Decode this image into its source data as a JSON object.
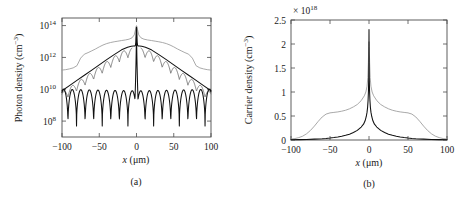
{
  "figure": {
    "panels": [
      "a",
      "b"
    ]
  },
  "panel_a": {
    "caption": "(a)",
    "ylabel": "Photon density (cm",
    "ylabel_exp": "−3",
    "ylabel_close": ")",
    "xlabel_var": "x",
    "xlabel_unit": "(μm)",
    "yticks": [
      "10",
      "10",
      "10",
      "10"
    ],
    "ytick_exps": [
      "8",
      "10",
      "12",
      "14"
    ],
    "xticks": [
      "−100",
      "−50",
      "0",
      "50",
      "100"
    ]
  },
  "panel_b": {
    "caption": "(b)",
    "ylabel": "Carrier density (cm",
    "ylabel_exp": "−3",
    "ylabel_close": ")",
    "xlabel_var": "x",
    "xlabel_unit": "(μm)",
    "exponent_label": "× 10",
    "exponent_sup": "18",
    "yticks": [
      "0",
      "0.5",
      "1",
      "1.5",
      "2",
      "2.5"
    ],
    "xticks": [
      "−100",
      "−50",
      "0",
      "50",
      "100"
    ]
  },
  "chart_data": [
    {
      "type": "line",
      "panel": "a",
      "title": "",
      "xlabel": "x (μm)",
      "ylabel": "Photon density (cm^-3)",
      "xlim": [
        -100,
        100
      ],
      "ylim": [
        10000000.0,
        300000000000000.0
      ],
      "yscale": "log",
      "xticks": [
        -100,
        -50,
        0,
        50,
        100
      ],
      "yticks": [
        100000000.0,
        10000000000.0,
        1000000000000.0,
        100000000000000.0
      ],
      "grid": false,
      "legend": "none",
      "series": [
        {
          "name": "upper-gray-broad",
          "color": "#9a9a9a",
          "comment": "smooth broad gray profile, plateau near 1e13, peak 1e14 at center",
          "x": [
            -100,
            -95,
            -90,
            -85,
            -80,
            -75,
            -70,
            -65,
            -60,
            -55,
            -50,
            -45,
            -40,
            -35,
            -30,
            -25,
            -20,
            -15,
            -10,
            -6,
            -3,
            -1.2,
            -0.5,
            0,
            0.5,
            1.2,
            3,
            6,
            10,
            15,
            20,
            25,
            30,
            35,
            40,
            45,
            50,
            55,
            60,
            65,
            70,
            75,
            80,
            85,
            90,
            95,
            100
          ],
          "y": [
            160000000000.0,
            170000000000.0,
            190000000000.0,
            220000000000.0,
            300000000000.0,
            900000000000.0,
            1600000000000.0,
            2000000000000.0,
            2600000000000.0,
            3400000000000.0,
            4600000000000.0,
            6000000000000.0,
            7400000000000.0,
            8600000000000.0,
            9600000000000.0,
            10500000000000.0,
            11500000000000.0,
            12500000000000.0,
            14000000000000.0,
            17000000000000.0,
            26000000000000.0,
            60000000000000.0,
            90000000000000.0,
            100000000000000.0,
            90000000000000.0,
            60000000000000.0,
            26000000000000.0,
            17000000000000.0,
            14000000000000.0,
            12500000000000.0,
            11500000000000.0,
            10500000000000.0,
            9600000000000.0,
            8600000000000.0,
            7400000000000.0,
            6000000000000.0,
            4600000000000.0,
            3400000000000.0,
            2600000000000.0,
            2000000000000.0,
            1600000000000.0,
            900000000000.0,
            300000000000.0,
            220000000000.0,
            190000000000.0,
            170000000000.0,
            160000000000.0
          ]
        },
        {
          "name": "dark-envelope",
          "color": "#111111",
          "comment": "smooth dark triangular envelope on log axis, apex ~5e12 near center plus narrow spike to 8e13",
          "x": [
            -100,
            -90,
            -80,
            -70,
            -60,
            -50,
            -40,
            -30,
            -20,
            -12,
            -7,
            -4,
            -2.5,
            -1.5,
            -0.9,
            -0.45,
            -0.15,
            0,
            0.15,
            0.45,
            0.9,
            1.5,
            2.5,
            4,
            7,
            12,
            20,
            30,
            40,
            50,
            60,
            70,
            80,
            90,
            100
          ],
          "y": [
            8000000000.0,
            17000000000.0,
            36000000000.0,
            76000000000.0,
            160000000000.0,
            340000000000.0,
            720000000000.0,
            1500000000000.0,
            3000000000000.0,
            4300000000000.0,
            5000000000000.0,
            5200000000000.0,
            5200000000000.0,
            5600000000000.0,
            9000000000000.0,
            40000000000000.0,
            75000000000000.0,
            80000000000000.0,
            75000000000000.0,
            40000000000000.0,
            9000000000000.0,
            5600000000000.0,
            5200000000000.0,
            5200000000000.0,
            5000000000000.0,
            4300000000000.0,
            3000000000000.0,
            1500000000000.0,
            720000000000.0,
            340000000000.0,
            160000000000.0,
            76000000000.0,
            36000000000.0,
            17000000000.0,
            8000000000.0
          ]
        },
        {
          "name": "oscillating-gray",
          "color": "#6e6e6e",
          "comment": "gray curve oscillating with shallow dips hugging the dark envelope from below",
          "envelope_ref": "dark-envelope",
          "oscillation_period_um": 11.5,
          "dip_depth_decades": 0.55
        },
        {
          "name": "oscillating-black-lower",
          "color": "#111111",
          "comment": "lower interference fringe pattern with deep nulls; lobe tops ~1e10 at edges decaying toward 3e8 near center-sides, central spike shared",
          "period_um": 11.5,
          "peak_edges": 10000000000.0,
          "peak_central_lobe": 8000000000.0,
          "null_floor": 50000000.0
        }
      ]
    },
    {
      "type": "line",
      "panel": "b",
      "title": "",
      "xlabel": "x (μm)",
      "ylabel": "Carrier density (cm^-3)",
      "y_multiplier": 1e+18,
      "xlim": [
        -100,
        100
      ],
      "ylim": [
        0,
        2.5
      ],
      "yscale": "linear",
      "xticks": [
        -100,
        -50,
        0,
        50,
        100
      ],
      "yticks": [
        0,
        0.5,
        1,
        1.5,
        2,
        2.5
      ],
      "grid": false,
      "legend": "none",
      "series": [
        {
          "name": "gray-broad-shoulders",
          "color": "#9a9a9a",
          "comment": "broad profile with shoulders near +/-50, peak ~2.05 at center",
          "x": [
            -100,
            -95,
            -90,
            -85,
            -80,
            -75,
            -70,
            -65,
            -60,
            -55,
            -50,
            -45,
            -40,
            -35,
            -30,
            -25,
            -20,
            -15,
            -10,
            -6,
            -4,
            -2.5,
            -1.5,
            -0.8,
            -0.3,
            0,
            0.3,
            0.8,
            1.5,
            2.5,
            4,
            6,
            10,
            15,
            20,
            25,
            30,
            35,
            40,
            45,
            50,
            55,
            60,
            65,
            70,
            75,
            80,
            85,
            90,
            95,
            100
          ],
          "y": [
            0.02,
            0.03,
            0.05,
            0.08,
            0.13,
            0.2,
            0.29,
            0.39,
            0.48,
            0.54,
            0.565,
            0.575,
            0.585,
            0.6,
            0.62,
            0.65,
            0.69,
            0.74,
            0.82,
            0.92,
            1.0,
            1.12,
            1.3,
            1.62,
            1.95,
            2.05,
            1.95,
            1.62,
            1.3,
            1.12,
            1.0,
            0.92,
            0.82,
            0.74,
            0.69,
            0.65,
            0.62,
            0.6,
            0.585,
            0.575,
            0.565,
            0.54,
            0.48,
            0.39,
            0.29,
            0.2,
            0.13,
            0.08,
            0.05,
            0.03,
            0.02
          ]
        },
        {
          "name": "dark-narrow-peak",
          "color": "#111111",
          "comment": "sharply peaked cusp reaching 2.3 at x=0, near zero beyond +/-60",
          "x": [
            -100,
            -90,
            -80,
            -70,
            -60,
            -55,
            -50,
            -45,
            -40,
            -35,
            -30,
            -25,
            -20,
            -15,
            -10,
            -7,
            -5,
            -3.5,
            -2.5,
            -1.8,
            -1.2,
            -0.7,
            -0.35,
            -0.15,
            0,
            0.15,
            0.35,
            0.7,
            1.2,
            1.8,
            2.5,
            3.5,
            5,
            7,
            10,
            15,
            20,
            25,
            30,
            35,
            40,
            45,
            50,
            55,
            60,
            70,
            80,
            90,
            100
          ],
          "y": [
            0.005,
            0.008,
            0.012,
            0.018,
            0.026,
            0.032,
            0.04,
            0.05,
            0.062,
            0.078,
            0.098,
            0.122,
            0.155,
            0.2,
            0.27,
            0.33,
            0.4,
            0.49,
            0.58,
            0.68,
            0.82,
            1.02,
            1.3,
            1.75,
            2.3,
            1.75,
            1.3,
            1.02,
            0.82,
            0.68,
            0.58,
            0.49,
            0.4,
            0.33,
            0.27,
            0.2,
            0.155,
            0.122,
            0.098,
            0.078,
            0.062,
            0.05,
            0.04,
            0.032,
            0.026,
            0.018,
            0.012,
            0.008,
            0.005
          ]
        }
      ]
    }
  ]
}
